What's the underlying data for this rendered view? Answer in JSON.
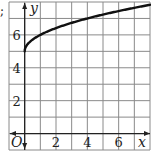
{
  "prefix_mark": ";",
  "chart_data": {
    "type": "line",
    "title": "",
    "function": "y = sqrt(x) + 5",
    "xlabel": "x",
    "ylabel": "y",
    "origin_label": "O",
    "xlim": [
      -1,
      8
    ],
    "ylim": [
      -1,
      8
    ],
    "grid": true,
    "x_ticks": [
      2,
      4,
      6
    ],
    "y_ticks": [
      2,
      4,
      6
    ],
    "x_tick_labels": [
      "2",
      "4",
      "6"
    ],
    "y_tick_labels": [
      "2",
      "4",
      "6"
    ],
    "series": [
      {
        "name": "curve",
        "x": [
          0,
          0.25,
          0.5,
          1,
          2,
          3,
          4,
          5,
          6,
          7,
          8
        ],
        "y": [
          5,
          5.5,
          5.71,
          6,
          6.41,
          6.73,
          7,
          7.24,
          7.45,
          7.65,
          7.83
        ]
      }
    ],
    "colors": {
      "grid": "#8a8a8a",
      "axis": "#222222",
      "curve": "#111111"
    }
  }
}
